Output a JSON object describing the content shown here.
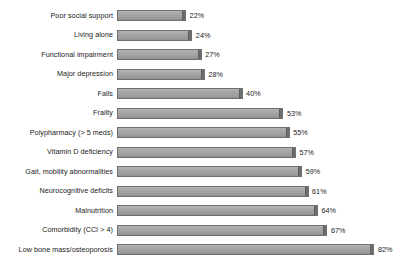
{
  "chart_data": {
    "type": "bar",
    "orientation": "horizontal",
    "title": "",
    "subtitle": "",
    "xlabel": "",
    "ylabel": "",
    "xlim": [
      0,
      88
    ],
    "grid": false,
    "legend": null,
    "value_suffix": "%",
    "categories": [
      "Poor social support",
      "Living alone",
      "Functional impairment",
      "Major depression",
      "Falls",
      "Frailty",
      "Polypharmacy (> 5 meds)",
      "Vitamin D deficiency",
      "Gait, mobility abnormalities",
      "Neurocognitive deficits",
      "Malnutrition",
      "Comorbidity (CCI > 4)",
      "Low bone mass/osteoporosis"
    ],
    "values": [
      22,
      24,
      27,
      28,
      40,
      53,
      55,
      57,
      59,
      61,
      64,
      67,
      82
    ],
    "value_labels": [
      "22%",
      "24%",
      "27%",
      "28%",
      "40%",
      "53%",
      "55%",
      "57%",
      "59%",
      "61%",
      "64%",
      "67%",
      "82%"
    ],
    "colors": {
      "bar_fill": "#a8a8a8",
      "bar_edge": "#6f6f6f",
      "bar_cap": "#6e6e6e",
      "background": "#ffffff",
      "text": "#1a1a1a"
    }
  }
}
